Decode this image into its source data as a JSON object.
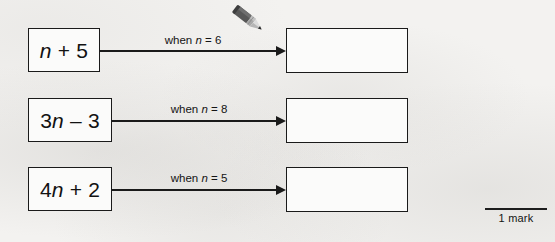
{
  "page": {
    "background_color": "#f3f2f0",
    "ink_color": "#1a1a1a"
  },
  "rows": [
    {
      "expression_prefix": "",
      "expression_var": "n",
      "expression_suffix": " + 5",
      "condition_prefix": "when ",
      "condition_var": "n",
      "condition_suffix": " = 6",
      "answer_value": ""
    },
    {
      "expression_prefix": "3",
      "expression_var": "n",
      "expression_suffix": " – 3",
      "condition_prefix": "when ",
      "condition_var": "n",
      "condition_suffix": " = 8",
      "answer_value": ""
    },
    {
      "expression_prefix": "4",
      "expression_var": "n",
      "expression_suffix": " + 2",
      "condition_prefix": "when ",
      "condition_var": "n",
      "condition_suffix": " = 5",
      "answer_value": ""
    }
  ],
  "pencil": {
    "icon": "pencil-icon",
    "body_color": "#4a4a4a",
    "ferrule_color": "#9a9a9a",
    "tip_color": "#d8d8d8"
  },
  "mark": {
    "label": "1 mark"
  }
}
